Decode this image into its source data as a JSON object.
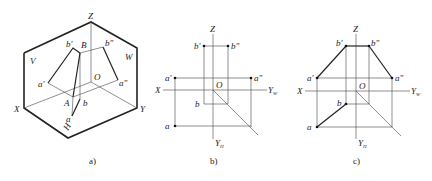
{
  "panels": [
    {
      "id": "a",
      "caption": "a)",
      "type": "isometric-projection-box",
      "labels": {
        "Z": "Z",
        "V": "V",
        "W": "W",
        "H": "H",
        "X": "X",
        "Y": "Y",
        "O": "O",
        "b_prime": "b'",
        "B": "B",
        "b_dprime": "b\"",
        "a_prime": "a'",
        "a_dprime": "a\"",
        "A": "A",
        "b": "b",
        "a": "a"
      }
    },
    {
      "id": "b",
      "caption": "b)",
      "type": "three-view-projection-points",
      "labels": {
        "Z": "Z",
        "X": "X",
        "O": "O",
        "Y": "Y",
        "W": "W",
        "H": "H",
        "b_prime": "b'",
        "b_dprime": "b\"",
        "a_prime": "a'",
        "a_dprime": "a\"",
        "b": "b",
        "a": "a"
      }
    },
    {
      "id": "c",
      "caption": "c)",
      "type": "three-view-projection-line",
      "labels": {
        "Z": "Z",
        "X": "X",
        "O": "O",
        "Y": "Y",
        "W": "W",
        "H": "H",
        "b_prime": "b'",
        "b_dprime": "b\"",
        "a_prime": "a'",
        "a_dprime": "a\"",
        "b": "b",
        "a": "a"
      }
    }
  ]
}
